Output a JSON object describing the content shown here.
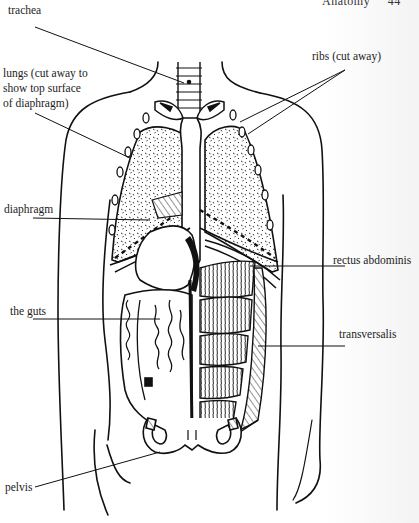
{
  "header": {
    "running_title": "Anatomy",
    "page_number": "44"
  },
  "figure": {
    "labels": {
      "trachea": "trachea",
      "lungs_line1": "lungs (cut away to",
      "lungs_line2": "show top surface",
      "lungs_line3": "of diaphragm)",
      "ribs": "ribs (cut away)",
      "diaphragm": "diaphragm",
      "rectus_abdominis": "rectus abdominis",
      "the_guts": "the guts",
      "transversalis": "transversalis",
      "pelvis": "pelvis"
    },
    "colors": {
      "ink": "#111111",
      "paper": "#ffffff"
    }
  }
}
